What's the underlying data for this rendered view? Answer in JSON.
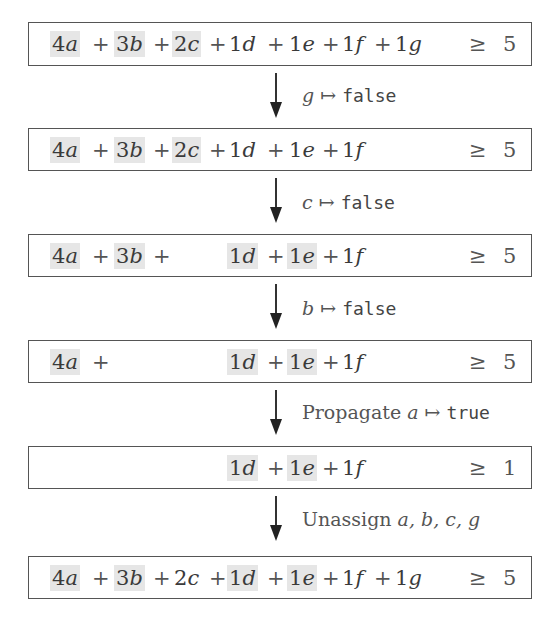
{
  "colors": {
    "highlight": "#e6e6e6",
    "border": "#555555",
    "text": "#3a3a3a"
  },
  "operators": {
    "plus": "+",
    "geq": "≥",
    "mapsto": "↦"
  },
  "constraints": [
    {
      "terms": [
        {
          "coef": "4",
          "var": "a",
          "highlight": true
        },
        {
          "coef": "3",
          "var": "b",
          "highlight": true
        },
        {
          "coef": "2",
          "var": "c",
          "highlight": true
        },
        {
          "coef": "1",
          "var": "d",
          "highlight": false
        },
        {
          "coef": "1",
          "var": "e",
          "highlight": false
        },
        {
          "coef": "1",
          "var": "f",
          "highlight": false
        },
        {
          "coef": "1",
          "var": "g",
          "highlight": false
        }
      ],
      "relation": "≥",
      "rhs": "5"
    },
    {
      "terms": [
        {
          "coef": "4",
          "var": "a",
          "highlight": true
        },
        {
          "coef": "3",
          "var": "b",
          "highlight": true
        },
        {
          "coef": "2",
          "var": "c",
          "highlight": true
        },
        {
          "coef": "1",
          "var": "d",
          "highlight": false
        },
        {
          "coef": "1",
          "var": "e",
          "highlight": false
        },
        {
          "coef": "1",
          "var": "f",
          "highlight": false
        }
      ],
      "relation": "≥",
      "rhs": "5"
    },
    {
      "terms": [
        {
          "coef": "4",
          "var": "a",
          "highlight": true
        },
        {
          "coef": "3",
          "var": "b",
          "highlight": true
        },
        {
          "coef": "1",
          "var": "d",
          "highlight": true
        },
        {
          "coef": "1",
          "var": "e",
          "highlight": true
        },
        {
          "coef": "1",
          "var": "f",
          "highlight": false
        }
      ],
      "relation": "≥",
      "rhs": "5"
    },
    {
      "terms": [
        {
          "coef": "4",
          "var": "a",
          "highlight": true
        },
        {
          "coef": "1",
          "var": "d",
          "highlight": true
        },
        {
          "coef": "1",
          "var": "e",
          "highlight": true
        },
        {
          "coef": "1",
          "var": "f",
          "highlight": false
        }
      ],
      "relation": "≥",
      "rhs": "5"
    },
    {
      "terms": [
        {
          "coef": "1",
          "var": "d",
          "highlight": true
        },
        {
          "coef": "1",
          "var": "e",
          "highlight": true
        },
        {
          "coef": "1",
          "var": "f",
          "highlight": false
        }
      ],
      "relation": "≥",
      "rhs": "1"
    },
    {
      "terms": [
        {
          "coef": "4",
          "var": "a",
          "highlight": true
        },
        {
          "coef": "3",
          "var": "b",
          "highlight": true
        },
        {
          "coef": "2",
          "var": "c",
          "highlight": false
        },
        {
          "coef": "1",
          "var": "d",
          "highlight": true
        },
        {
          "coef": "1",
          "var": "e",
          "highlight": true
        },
        {
          "coef": "1",
          "var": "f",
          "highlight": false
        },
        {
          "coef": "1",
          "var": "g",
          "highlight": false
        }
      ],
      "relation": "≥",
      "rhs": "5"
    }
  ],
  "steps": [
    {
      "prefix": "",
      "var": "g",
      "arrow": "↦",
      "value": "false"
    },
    {
      "prefix": "",
      "var": "c",
      "arrow": "↦",
      "value": "false"
    },
    {
      "prefix": "",
      "var": "b",
      "arrow": "↦",
      "value": "false"
    },
    {
      "prefix": "Propagate ",
      "var": "a",
      "arrow": "↦",
      "value": "true"
    },
    {
      "prefix": "Unassign ",
      "var": "a, b, c, g",
      "arrow": "",
      "value": ""
    }
  ]
}
